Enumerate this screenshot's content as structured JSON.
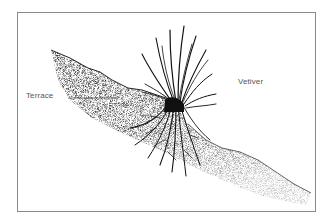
{
  "diagram": {
    "labels": {
      "terrace": "Terrace",
      "vetiver": "Vetiver"
    },
    "elements": {
      "frame": "border-frame",
      "slope": "soil-slope",
      "plant": "vetiver-grass-clump",
      "roots": "root-system"
    },
    "colors": {
      "ink": "#111111",
      "soil": "#3a3a3a",
      "label": "#555555",
      "frame": "#8a8a8a",
      "background": "#ffffff"
    }
  }
}
